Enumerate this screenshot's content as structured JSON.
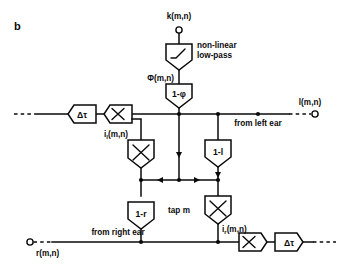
{
  "figure": {
    "panel_label": "b",
    "caption_note": "tap m"
  },
  "signals": {
    "k_input": "k(m,n)",
    "phi": "Φ(m,n)",
    "l_output": "l(m,n)",
    "r_input": "r(m,n)",
    "i_l": "i",
    "i_l_sub": "l",
    "i_l_args": "(m,n)",
    "i_r": "i",
    "i_r_sub": "r",
    "i_r_args": "(m,n)"
  },
  "annotations": {
    "from_left_ear": "from left ear",
    "from_right_ear": "from right ear",
    "nonlinear_line1": "non-linear",
    "nonlinear_line2": "low-pass",
    "tap": "tap m"
  },
  "blocks": {
    "nonlinear_lowpass": "",
    "one_minus_phi": "1-φ",
    "one_minus_l": "1-l",
    "one_minus_r": "1-r",
    "delay_top": "Δτ",
    "delay_bottom": "Δτ",
    "mult_top_left": "×",
    "mult_mid_left": "×",
    "mult_mid_right": "×",
    "mult_bottom_right": "×"
  },
  "colors": {
    "ink": "#0a0a0a",
    "paper": "#ffffff"
  }
}
